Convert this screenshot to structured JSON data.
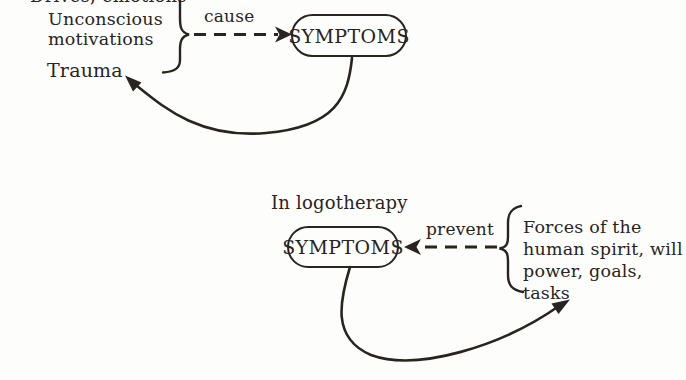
{
  "colors": {
    "ink": "#29241f",
    "paper": "#fdfdfc"
  },
  "top_diagram": {
    "cutoff_label": "Drives, emotions",
    "unconscious_label": "Unconscious\nmotivations",
    "trauma_label": "Trauma",
    "relation_label": "cause",
    "node_label": "SYMPTOMS"
  },
  "bottom_diagram": {
    "context_label": "In logotherapy",
    "node_label": "SYMPTOMS",
    "relation_label": "prevent",
    "forces_label": "Forces of the\nhuman spirit, will\npower, goals, tasks"
  }
}
